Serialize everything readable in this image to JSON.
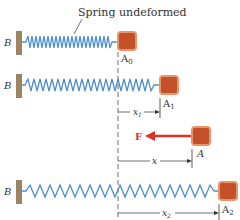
{
  "caption": "Spring undeformed",
  "wall_label": "B",
  "rows": [
    {
      "block_label": "A",
      "subscript": "0"
    },
    {
      "block_label": "A",
      "subscript": "1",
      "dimension": "x",
      "dim_sub": "1"
    },
    {
      "block_label": "A",
      "subscript": "",
      "dimension": "x",
      "dim_sub": "",
      "force": "F"
    },
    {
      "block_label": "A",
      "subscript": "2",
      "dimension": "x",
      "dim_sub": "2"
    }
  ],
  "colors": {
    "spring": "#4f8fd0",
    "block_fill": "#c4502a",
    "block_border": "#e8956a",
    "wall": "#9c8462",
    "force": "#e0302a",
    "line": "#333333"
  }
}
